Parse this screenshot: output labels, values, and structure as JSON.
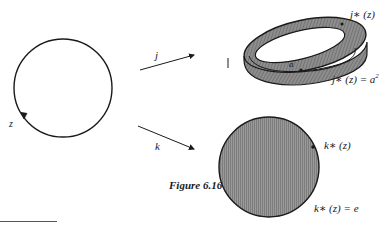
{
  "figure": {
    "caption": "Figure 6.16",
    "source_space": {
      "shape": "circle",
      "path_label": "z"
    },
    "maps": [
      {
        "name": "j",
        "target": "torus",
        "labels": {
          "path": "j∗ (z)",
          "equation_lhs": "j∗ (z) = a",
          "equation_exp": "2",
          "generator": "a"
        }
      },
      {
        "name": "k",
        "target": "disk",
        "labels": {
          "path": "k∗ (z)",
          "equation": "k∗ (z) = e"
        }
      }
    ],
    "colors": {
      "ink": "#1a1a1a",
      "shading": "#8c8c8c",
      "background": "#ffffff"
    }
  }
}
